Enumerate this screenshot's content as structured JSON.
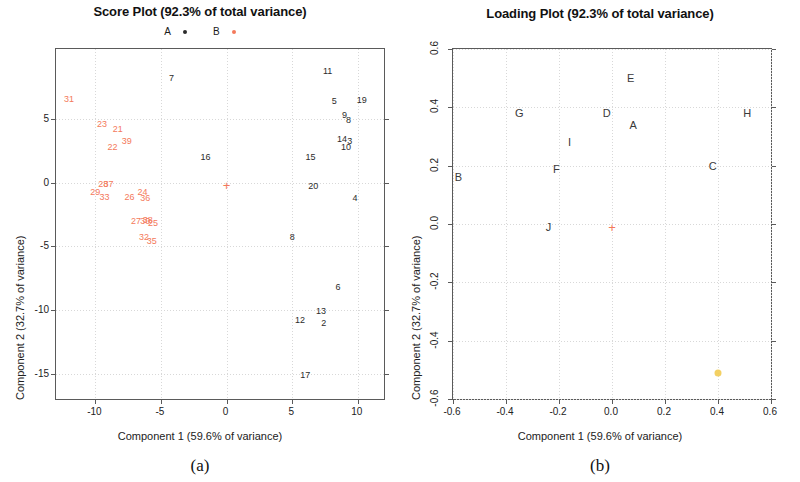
{
  "figure": {
    "panels": [
      {
        "caption": "(a)"
      },
      {
        "caption": "(b)"
      }
    ]
  },
  "score_plot": {
    "title": "Score Plot (92.3% of total variance)",
    "xlabel": "Component 1 (59.6% of variance)",
    "ylabel": "Component 2 (32.7% of variance)",
    "legend": [
      {
        "label": "A",
        "color": "#2b2b2b"
      },
      {
        "label": "B",
        "color": "#f4795b"
      }
    ],
    "xticks": [
      "-10",
      "-5",
      "0",
      "5",
      "10"
    ],
    "yticks": [
      "5",
      "0",
      "-5",
      "-10",
      "-15"
    ]
  },
  "loading_plot": {
    "title": "Loading Plot (92.3% of total variance)",
    "xlabel": "Component 1 (59.6% of variance)",
    "ylabel": "Component 2 (32.7% of variance)",
    "xticks": [
      "-0.6",
      "-0.4",
      "-0.2",
      "0.0",
      "0.2",
      "0.4",
      "0.6"
    ],
    "yticks": [
      "0.6",
      "0.4",
      "0.2",
      "0.0",
      "-0.2",
      "-0.4",
      "-0.6"
    ]
  },
  "chart_data": [
    {
      "type": "scatter",
      "panel": "(a)",
      "title": "Score Plot (92.3% of total variance)",
      "xlabel": "Component 1 (59.6% of variance)",
      "ylabel": "Component 2 (32.7% of variance)",
      "xlim": [
        -13.0,
        12.0
      ],
      "ylim": [
        -17.0,
        10.5
      ],
      "xticks": [
        -10,
        -5,
        0,
        5,
        10
      ],
      "yticks": [
        5,
        0,
        -5,
        -10,
        -15
      ],
      "grid": true,
      "legend_position": "above-plot",
      "series": [
        {
          "name": "A",
          "color": "#2b2b2b",
          "marker": "text-label",
          "points": [
            {
              "label": "7",
              "x": -4.2,
              "y": 8.2
            },
            {
              "label": "11",
              "x": 7.7,
              "y": 8.8
            },
            {
              "label": "5",
              "x": 8.2,
              "y": 6.4
            },
            {
              "label": "19",
              "x": 10.3,
              "y": 6.5
            },
            {
              "label": "9",
              "x": 9.0,
              "y": 5.3
            },
            {
              "label": "8",
              "x": 9.3,
              "y": 4.9
            },
            {
              "label": "14",
              "x": 8.8,
              "y": 3.4
            },
            {
              "label": "3",
              "x": 9.4,
              "y": 3.3
            },
            {
              "label": "10",
              "x": 9.1,
              "y": 2.8
            },
            {
              "label": "16",
              "x": -1.6,
              "y": 2.0
            },
            {
              "label": "15",
              "x": 6.4,
              "y": 2.0
            },
            {
              "label": "20",
              "x": 6.6,
              "y": -0.3
            },
            {
              "label": "4",
              "x": 9.8,
              "y": -1.2
            },
            {
              "label": "8",
              "x": 5.0,
              "y": -4.3
            },
            {
              "label": "6",
              "x": 8.5,
              "y": -8.2
            },
            {
              "label": "13",
              "x": 7.2,
              "y": -10.1
            },
            {
              "label": "12",
              "x": 5.6,
              "y": -10.8
            },
            {
              "label": "2",
              "x": 7.4,
              "y": -11.0
            },
            {
              "label": "17",
              "x": 6.0,
              "y": -15.1
            }
          ]
        },
        {
          "name": "B",
          "color": "#f4795b",
          "marker": "text-label",
          "points": [
            {
              "label": "31",
              "x": -12.0,
              "y": 6.6
            },
            {
              "label": "23",
              "x": -9.5,
              "y": 4.6
            },
            {
              "label": "21",
              "x": -8.3,
              "y": 4.2
            },
            {
              "label": "39",
              "x": -7.6,
              "y": 3.3
            },
            {
              "label": "22",
              "x": -8.7,
              "y": 2.8
            },
            {
              "label": "28",
              "x": -9.4,
              "y": -0.1
            },
            {
              "label": "37",
              "x": -9.0,
              "y": -0.1
            },
            {
              "label": "29",
              "x": -10.0,
              "y": -0.7
            },
            {
              "label": "33",
              "x": -9.3,
              "y": -1.1
            },
            {
              "label": "26",
              "x": -7.4,
              "y": -1.1
            },
            {
              "label": "24",
              "x": -6.4,
              "y": -0.7
            },
            {
              "label": "36",
              "x": -6.2,
              "y": -1.2
            },
            {
              "label": "27",
              "x": -6.9,
              "y": -3.0
            },
            {
              "label": "30",
              "x": -6.2,
              "y": -3.0
            },
            {
              "label": "38",
              "x": -6.0,
              "y": -2.9
            },
            {
              "label": "25",
              "x": -5.6,
              "y": -3.2
            },
            {
              "label": "32",
              "x": -6.3,
              "y": -4.3
            },
            {
              "label": "35",
              "x": -5.7,
              "y": -4.6
            }
          ]
        }
      ],
      "centroids": [
        {
          "label": "+",
          "x": 0.0,
          "y": -0.2,
          "color": "#f4795b"
        }
      ]
    },
    {
      "type": "scatter",
      "panel": "(b)",
      "title": "Loading Plot (92.3% of total variance)",
      "xlabel": "Component 1 (59.6% of variance)",
      "ylabel": "Component 2 (32.7% of variance)",
      "xlim": [
        -0.6,
        0.6
      ],
      "ylim": [
        -0.6,
        0.6
      ],
      "xticks": [
        -0.6,
        -0.4,
        -0.2,
        0.0,
        0.2,
        0.4,
        0.6
      ],
      "yticks": [
        0.6,
        0.4,
        0.2,
        0.0,
        -0.2,
        -0.4,
        -0.6
      ],
      "grid": true,
      "series": [
        {
          "name": "loadings",
          "color": "#3a3a3a",
          "marker": "text-label",
          "points": [
            {
              "label": "E",
              "x": 0.07,
              "y": 0.5
            },
            {
              "label": "G",
              "x": -0.35,
              "y": 0.38
            },
            {
              "label": "D",
              "x": -0.02,
              "y": 0.38
            },
            {
              "label": "H",
              "x": 0.51,
              "y": 0.38
            },
            {
              "label": "A",
              "x": 0.08,
              "y": 0.34
            },
            {
              "label": "I",
              "x": -0.16,
              "y": 0.28
            },
            {
              "label": "F",
              "x": -0.21,
              "y": 0.19
            },
            {
              "label": "C",
              "x": 0.38,
              "y": 0.2
            },
            {
              "label": "B",
              "x": -0.58,
              "y": 0.16
            },
            {
              "label": "J",
              "x": -0.24,
              "y": -0.01
            }
          ]
        }
      ],
      "centroids": [
        {
          "label": "+",
          "x": 0.0,
          "y": -0.01,
          "color": "#f4795b"
        }
      ],
      "markers": [
        {
          "shape": "circle",
          "x": 0.4,
          "y": -0.51,
          "color": "#f2cd5b"
        }
      ]
    }
  ]
}
